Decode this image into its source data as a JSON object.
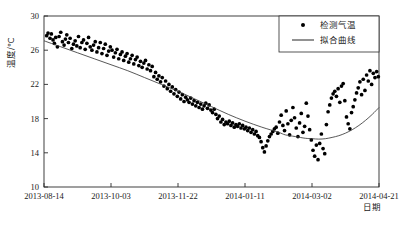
{
  "chart_data": {
    "type": "scatter",
    "title": "",
    "xlabel": "日期",
    "ylabel": "温度/℃",
    "ylim": [
      10,
      30
    ],
    "yticks": [
      10,
      14,
      18,
      22,
      26,
      30
    ],
    "xticks": [
      "2013-08-14",
      "2013-10-03",
      "2013-11-22",
      "2014-01-11",
      "2014-03-02",
      "2014-04-21"
    ],
    "grid": false,
    "legend_position": "top-right",
    "series": [
      {
        "name": "检测气温",
        "marker": "dot",
        "color": "#000000",
        "points": [
          [
            0.008,
            27.7
          ],
          [
            0.012,
            28.0
          ],
          [
            0.018,
            27.4
          ],
          [
            0.022,
            27.9
          ],
          [
            0.027,
            27.2
          ],
          [
            0.031,
            26.8
          ],
          [
            0.035,
            27.5
          ],
          [
            0.04,
            26.4
          ],
          [
            0.045,
            27.6
          ],
          [
            0.05,
            28.1
          ],
          [
            0.055,
            27.0
          ],
          [
            0.06,
            26.6
          ],
          [
            0.064,
            27.3
          ],
          [
            0.068,
            27.8
          ],
          [
            0.073,
            26.9
          ],
          [
            0.078,
            27.4
          ],
          [
            0.083,
            26.2
          ],
          [
            0.088,
            26.7
          ],
          [
            0.093,
            27.1
          ],
          [
            0.098,
            26.5
          ],
          [
            0.103,
            27.6
          ],
          [
            0.108,
            26.3
          ],
          [
            0.113,
            26.9
          ],
          [
            0.118,
            27.2
          ],
          [
            0.123,
            26.1
          ],
          [
            0.128,
            26.8
          ],
          [
            0.133,
            27.5
          ],
          [
            0.138,
            26.4
          ],
          [
            0.143,
            26.0
          ],
          [
            0.148,
            26.6
          ],
          [
            0.153,
            27.0
          ],
          [
            0.158,
            25.8
          ],
          [
            0.163,
            26.3
          ],
          [
            0.168,
            26.9
          ],
          [
            0.173,
            25.6
          ],
          [
            0.178,
            26.2
          ],
          [
            0.183,
            26.7
          ],
          [
            0.188,
            25.4
          ],
          [
            0.193,
            25.9
          ],
          [
            0.198,
            26.4
          ],
          [
            0.203,
            26.0
          ],
          [
            0.208,
            25.2
          ],
          [
            0.213,
            25.7
          ],
          [
            0.218,
            26.1
          ],
          [
            0.223,
            25.0
          ],
          [
            0.228,
            25.5
          ],
          [
            0.233,
            25.8
          ],
          [
            0.238,
            24.8
          ],
          [
            0.243,
            25.3
          ],
          [
            0.248,
            25.6
          ],
          [
            0.253,
            24.6
          ],
          [
            0.258,
            25.0
          ],
          [
            0.263,
            25.4
          ],
          [
            0.268,
            24.4
          ],
          [
            0.273,
            24.9
          ],
          [
            0.278,
            25.2
          ],
          [
            0.283,
            24.2
          ],
          [
            0.288,
            24.7
          ],
          [
            0.293,
            24.0
          ],
          [
            0.298,
            24.5
          ],
          [
            0.303,
            24.8
          ],
          [
            0.308,
            23.8
          ],
          [
            0.313,
            24.3
          ],
          [
            0.318,
            23.6
          ],
          [
            0.323,
            24.1
          ],
          [
            0.328,
            22.9
          ],
          [
            0.333,
            23.4
          ],
          [
            0.338,
            22.6
          ],
          [
            0.343,
            23.0
          ],
          [
            0.348,
            22.3
          ],
          [
            0.353,
            22.8
          ],
          [
            0.358,
            21.8
          ],
          [
            0.363,
            22.4
          ],
          [
            0.368,
            21.5
          ],
          [
            0.373,
            22.0
          ],
          [
            0.378,
            21.2
          ],
          [
            0.383,
            21.7
          ],
          [
            0.388,
            20.9
          ],
          [
            0.393,
            21.4
          ],
          [
            0.398,
            20.6
          ],
          [
            0.403,
            21.1
          ],
          [
            0.408,
            20.3
          ],
          [
            0.413,
            20.8
          ],
          [
            0.418,
            20.0
          ],
          [
            0.423,
            20.5
          ],
          [
            0.428,
            20.2
          ],
          [
            0.433,
            19.9
          ],
          [
            0.438,
            20.4
          ],
          [
            0.443,
            19.7
          ],
          [
            0.448,
            20.1
          ],
          [
            0.453,
            19.5
          ],
          [
            0.458,
            19.9
          ],
          [
            0.463,
            19.3
          ],
          [
            0.468,
            19.7
          ],
          [
            0.473,
            19.1
          ],
          [
            0.478,
            19.5
          ],
          [
            0.483,
            19.8
          ],
          [
            0.488,
            19.2
          ],
          [
            0.493,
            19.6
          ],
          [
            0.498,
            19.0
          ],
          [
            0.503,
            18.7
          ],
          [
            0.508,
            19.1
          ],
          [
            0.513,
            18.5
          ],
          [
            0.518,
            18.0
          ],
          [
            0.523,
            18.3
          ],
          [
            0.528,
            17.6
          ],
          [
            0.533,
            17.9
          ],
          [
            0.538,
            17.3
          ],
          [
            0.543,
            17.6
          ],
          [
            0.548,
            17.4
          ],
          [
            0.553,
            17.7
          ],
          [
            0.558,
            17.2
          ],
          [
            0.563,
            17.5
          ],
          [
            0.568,
            17.0
          ],
          [
            0.573,
            17.3
          ],
          [
            0.578,
            17.1
          ],
          [
            0.583,
            17.4
          ],
          [
            0.588,
            16.9
          ],
          [
            0.593,
            17.2
          ],
          [
            0.598,
            16.8
          ],
          [
            0.603,
            17.0
          ],
          [
            0.608,
            16.6
          ],
          [
            0.613,
            16.9
          ],
          [
            0.618,
            16.4
          ],
          [
            0.623,
            16.7
          ],
          [
            0.628,
            16.2
          ],
          [
            0.633,
            16.5
          ],
          [
            0.638,
            16.0
          ],
          [
            0.643,
            15.8
          ],
          [
            0.648,
            15.3
          ],
          [
            0.653,
            14.6
          ],
          [
            0.658,
            14.1
          ],
          [
            0.663,
            14.8
          ],
          [
            0.668,
            15.4
          ],
          [
            0.673,
            15.9
          ],
          [
            0.678,
            16.2
          ],
          [
            0.683,
            16.5
          ],
          [
            0.688,
            16.8
          ],
          [
            0.693,
            17.0
          ],
          [
            0.698,
            16.3
          ],
          [
            0.703,
            17.6
          ],
          [
            0.708,
            18.4
          ],
          [
            0.713,
            17.2
          ],
          [
            0.718,
            16.6
          ],
          [
            0.723,
            18.9
          ],
          [
            0.728,
            17.4
          ],
          [
            0.733,
            16.1
          ],
          [
            0.738,
            17.8
          ],
          [
            0.743,
            19.3
          ],
          [
            0.748,
            18.1
          ],
          [
            0.753,
            16.9
          ],
          [
            0.758,
            15.9
          ],
          [
            0.763,
            17.5
          ],
          [
            0.768,
            18.6
          ],
          [
            0.773,
            16.4
          ],
          [
            0.778,
            17.1
          ],
          [
            0.783,
            19.8
          ],
          [
            0.788,
            18.3
          ],
          [
            0.793,
            16.7
          ],
          [
            0.798,
            15.5
          ],
          [
            0.803,
            14.3
          ],
          [
            0.808,
            13.6
          ],
          [
            0.813,
            14.9
          ],
          [
            0.818,
            13.2
          ],
          [
            0.823,
            15.1
          ],
          [
            0.828,
            16.2
          ],
          [
            0.833,
            14.5
          ],
          [
            0.838,
            13.9
          ],
          [
            0.843,
            17.3
          ],
          [
            0.848,
            18.8
          ],
          [
            0.853,
            19.6
          ],
          [
            0.858,
            20.4
          ],
          [
            0.863,
            20.9
          ],
          [
            0.868,
            21.2
          ],
          [
            0.873,
            20.6
          ],
          [
            0.878,
            21.5
          ],
          [
            0.883,
            19.9
          ],
          [
            0.888,
            21.8
          ],
          [
            0.893,
            22.1
          ],
          [
            0.898,
            20.1
          ],
          [
            0.903,
            18.2
          ],
          [
            0.908,
            17.4
          ],
          [
            0.913,
            16.8
          ],
          [
            0.918,
            18.7
          ],
          [
            0.923,
            19.4
          ],
          [
            0.928,
            20.2
          ],
          [
            0.933,
            21.0
          ],
          [
            0.938,
            21.6
          ],
          [
            0.943,
            22.3
          ],
          [
            0.948,
            20.8
          ],
          [
            0.953,
            22.6
          ],
          [
            0.958,
            21.3
          ],
          [
            0.963,
            23.1
          ],
          [
            0.968,
            22.4
          ],
          [
            0.973,
            23.6
          ],
          [
            0.978,
            22.0
          ],
          [
            0.983,
            23.3
          ],
          [
            0.988,
            22.8
          ],
          [
            0.993,
            23.5
          ],
          [
            0.998,
            22.9
          ]
        ]
      },
      {
        "name": "拟合曲线",
        "marker": "line",
        "color": "#000000",
        "description": "二次拟合曲线，最低点约在 2014-02 附近 15.6℃",
        "fit_points": [
          [
            0.0,
            27.1
          ],
          [
            0.05,
            26.4
          ],
          [
            0.1,
            25.7
          ],
          [
            0.15,
            25.0
          ],
          [
            0.2,
            24.3
          ],
          [
            0.25,
            23.6
          ],
          [
            0.3,
            22.8
          ],
          [
            0.35,
            22.0
          ],
          [
            0.4,
            21.2
          ],
          [
            0.45,
            20.3
          ],
          [
            0.5,
            19.4
          ],
          [
            0.55,
            18.5
          ],
          [
            0.6,
            17.7
          ],
          [
            0.65,
            17.0
          ],
          [
            0.7,
            16.4
          ],
          [
            0.72,
            16.1
          ],
          [
            0.75,
            15.9
          ],
          [
            0.78,
            15.7
          ],
          [
            0.8,
            15.65
          ],
          [
            0.82,
            15.6
          ],
          [
            0.84,
            15.65
          ],
          [
            0.86,
            15.8
          ],
          [
            0.88,
            16.0
          ],
          [
            0.9,
            16.3
          ],
          [
            0.92,
            16.7
          ],
          [
            0.94,
            17.2
          ],
          [
            0.96,
            17.8
          ],
          [
            0.98,
            18.5
          ],
          [
            1.0,
            19.3
          ]
        ]
      }
    ]
  },
  "legend": {
    "items": [
      {
        "label": "检测气温",
        "marker": "dot"
      },
      {
        "label": "拟合曲线",
        "marker": "line"
      }
    ]
  },
  "axes": {
    "y_title": "温度/℃",
    "x_title": "日期",
    "y_tick_labels": [
      "30",
      "26",
      "22",
      "18",
      "14",
      "10"
    ],
    "x_tick_labels": [
      "2013-08-14",
      "2013-10-03",
      "2013-11-22",
      "2014-01-11",
      "2014-03-02",
      "2014-04-21"
    ]
  },
  "colors": {
    "background": "#ffffff",
    "axis": "#2b2b2b",
    "marker": "#000000",
    "fit_line": "#3a3a3a",
    "text": "#1a1a1a"
  }
}
